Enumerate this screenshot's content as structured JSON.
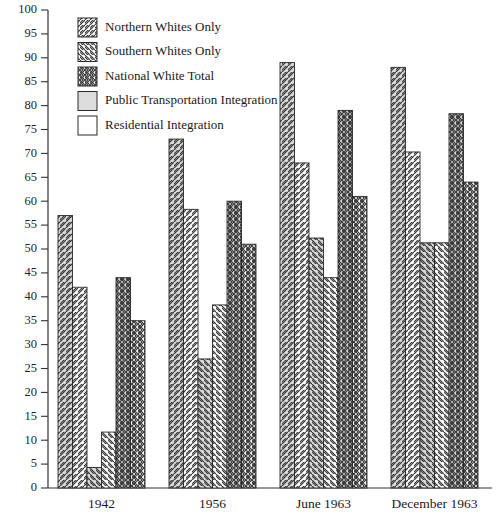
{
  "chart_data": {
    "type": "bar",
    "title": "",
    "xlabel": "",
    "ylabel": "",
    "ylim": [
      0,
      100
    ],
    "ytick_step": 5,
    "grid": false,
    "legend_position": "top-left-inside",
    "categories": [
      "1942",
      "1956",
      "June 1963",
      "December 1963"
    ],
    "legend": [
      "Northern Whites Only",
      "Southern Whites Only",
      "National White Total",
      "Public Transportation Integration",
      "Residential Integration"
    ],
    "yticks": [
      "0",
      "5",
      "10",
      "15",
      "20",
      "25",
      "30",
      "35",
      "40",
      "45",
      "50",
      "55",
      "60",
      "65",
      "70",
      "75",
      "80",
      "85",
      "90",
      "95",
      "100"
    ],
    "series": [
      {
        "name": "Northern Whites Only — Public Transportation Integration",
        "group": "Northern Whites Only",
        "measure": "Public Transportation Integration",
        "pattern": "diag-right-gray",
        "values": [
          57,
          73,
          89,
          88
        ]
      },
      {
        "name": "Northern Whites Only — Residential Integration",
        "group": "Northern Whites Only",
        "measure": "Residential Integration",
        "pattern": "diag-right-white",
        "values": [
          42,
          58.3,
          68,
          70.3
        ]
      },
      {
        "name": "Southern Whites Only — Public Transportation Integration",
        "group": "Southern Whites Only",
        "measure": "Public Transportation Integration",
        "pattern": "diag-left-gray",
        "values": [
          4.3,
          27,
          52.3,
          51.3
        ]
      },
      {
        "name": "Southern Whites Only — Residential Integration",
        "group": "Southern Whites Only",
        "measure": "Residential Integration",
        "pattern": "diag-left-white",
        "values": [
          11.7,
          38.3,
          44,
          51.3
        ]
      },
      {
        "name": "National White Total — Public Transportation Integration",
        "group": "National White Total",
        "measure": "Public Transportation Integration",
        "pattern": "cross-gray",
        "values": [
          44,
          60,
          79,
          78.3
        ]
      },
      {
        "name": "National White Total — Residential Integration",
        "group": "National White Total",
        "measure": "Residential Integration",
        "pattern": "cross-white",
        "values": [
          35,
          51,
          61,
          64
        ]
      }
    ],
    "colors": {
      "gray_fill": "#d9d9d9",
      "white_fill": "#ffffff",
      "hatch_stroke": "#3a3a3a",
      "axis": "#333333",
      "text": "#1a1a1a"
    }
  }
}
